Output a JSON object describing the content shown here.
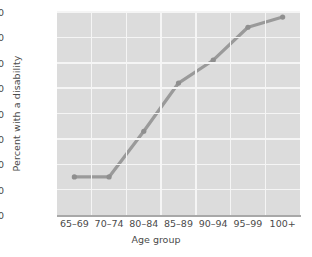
{
  "chart_data": {
    "type": "line",
    "title": "",
    "subtitle": "",
    "xlabel": "Age group",
    "ylabel": "Percent with a disability",
    "categories": [
      "65–69",
      "70–74",
      "80–84",
      "85–89",
      "90–94",
      "95–99",
      "100+"
    ],
    "values": [
      15,
      15,
      33,
      52,
      61,
      74,
      78
    ],
    "series": [
      {
        "name": "Percent with a disability",
        "values": [
          15,
          15,
          33,
          52,
          61,
          74,
          78
        ]
      }
    ],
    "ylim": [
      0,
      80
    ],
    "yticks": [
      0,
      10,
      20,
      30,
      40,
      50,
      60,
      70,
      80
    ],
    "ytick_labels": [
      "0",
      "10",
      "20",
      "30",
      "40",
      "50",
      "60",
      "70",
      "80"
    ],
    "grid": true,
    "legend": "none",
    "colors": {
      "line": "#9a9a9a",
      "marker": "#8f8f8f",
      "plot_background": "#dcdcdc",
      "gridline": "#f5f5f5",
      "axis": "#a8a8a8",
      "text": "#4a4a4a",
      "page_background": "#ffffff"
    }
  }
}
